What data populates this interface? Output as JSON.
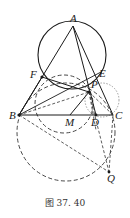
{
  "figure": {
    "caption": "图 37. 40",
    "points": {
      "A": {
        "label": "A",
        "x": 73,
        "y": 26
      },
      "B": {
        "label": "B",
        "x": 19,
        "y": 115
      },
      "C": {
        "label": "C",
        "x": 113,
        "y": 115
      },
      "D": {
        "label": "D",
        "x": 96,
        "y": 115
      },
      "E": {
        "label": "E",
        "x": 101,
        "y": 72
      },
      "F": {
        "label": "F",
        "x": 42,
        "y": 77
      },
      "M": {
        "label": "M",
        "x": 70,
        "y": 115
      },
      "P": {
        "label": "P",
        "x": 89,
        "y": 92
      },
      "Q": {
        "label": "Q",
        "x": 109,
        "y": 172
      }
    },
    "colors": {
      "stroke": "#1a1a1a",
      "dashed": "#333333",
      "dotted": "#888888"
    }
  }
}
